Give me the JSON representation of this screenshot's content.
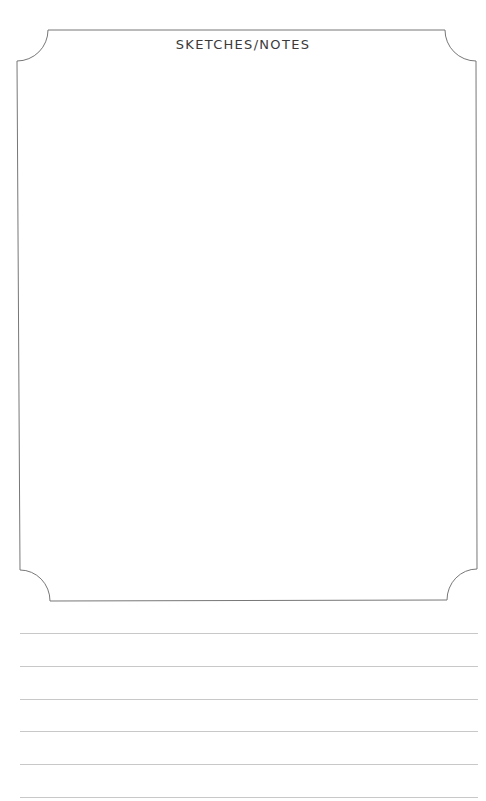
{
  "page": {
    "title": "SKETCHES/NOTES",
    "frame_color": "#777777",
    "rule_color": "#c8c8c8",
    "ruled_lines": [
      {
        "y": 633
      },
      {
        "y": 666
      },
      {
        "y": 699
      },
      {
        "y": 731
      },
      {
        "y": 764
      },
      {
        "y": 797
      }
    ]
  }
}
